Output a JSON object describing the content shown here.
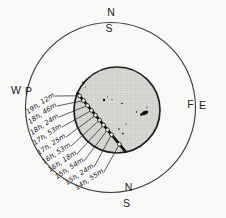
{
  "compass": {
    "top_outer": "N",
    "top_inner": "S",
    "left_outer": "W",
    "left_inner": "P",
    "right_inner": "F",
    "right_outer": "E",
    "bottom_inner": "N",
    "bottom_outer": "S"
  },
  "transit_times": [
    "19h, 12m",
    "18h, 46m",
    "18h, 24m",
    "17h, 53m",
    "17h, 25m",
    "16h, 53m",
    "16h, 18m",
    "15h, 54m",
    "15h, 24m",
    "14h, 55m"
  ]
}
